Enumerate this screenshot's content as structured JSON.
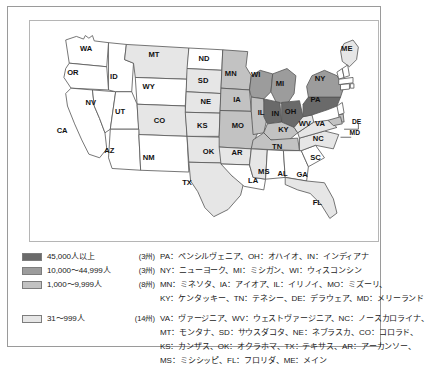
{
  "figure": {
    "type": "choropleth-map",
    "region": "United States"
  },
  "map": {
    "title": "",
    "state_labels": [
      {
        "code": "WA",
        "x": 63,
        "y": 30
      },
      {
        "code": "OR",
        "x": 48,
        "y": 57
      },
      {
        "code": "ID",
        "x": 94,
        "y": 62
      },
      {
        "code": "MT",
        "x": 139,
        "y": 37
      },
      {
        "code": "ND",
        "x": 195,
        "y": 42
      },
      {
        "code": "SD",
        "x": 194,
        "y": 66
      },
      {
        "code": "NE",
        "x": 197,
        "y": 90
      },
      {
        "code": "WY",
        "x": 133,
        "y": 73
      },
      {
        "code": "NV",
        "x": 68,
        "y": 91
      },
      {
        "code": "UT",
        "x": 101,
        "y": 101
      },
      {
        "code": "CA",
        "x": 36,
        "y": 122
      },
      {
        "code": "AZ",
        "x": 89,
        "y": 145
      },
      {
        "code": "CO",
        "x": 145,
        "y": 111
      },
      {
        "code": "NM",
        "x": 133,
        "y": 152
      },
      {
        "code": "KS",
        "x": 193,
        "y": 117
      },
      {
        "code": "OK",
        "x": 200,
        "y": 146
      },
      {
        "code": "TX",
        "x": 176,
        "y": 181
      },
      {
        "code": "MN",
        "x": 225,
        "y": 58
      },
      {
        "code": "IA",
        "x": 232,
        "y": 88
      },
      {
        "code": "MO",
        "x": 233,
        "y": 117
      },
      {
        "code": "AR",
        "x": 232,
        "y": 147
      },
      {
        "code": "LA",
        "x": 250,
        "y": 178
      },
      {
        "code": "MS",
        "x": 262,
        "y": 168
      },
      {
        "code": "AL",
        "x": 283,
        "y": 170
      },
      {
        "code": "GA",
        "x": 305,
        "y": 171
      },
      {
        "code": "FL",
        "x": 322,
        "y": 203
      },
      {
        "code": "WI",
        "x": 253,
        "y": 60
      },
      {
        "code": "IL",
        "x": 259,
        "y": 102
      },
      {
        "code": "MI",
        "x": 280,
        "y": 70
      },
      {
        "code": "IN",
        "x": 275,
        "y": 103
      },
      {
        "code": "OH",
        "x": 292,
        "y": 101
      },
      {
        "code": "KY",
        "x": 284,
        "y": 121
      },
      {
        "code": "TN",
        "x": 277,
        "y": 140
      },
      {
        "code": "PA",
        "x": 320,
        "y": 87
      },
      {
        "code": "NY",
        "x": 325,
        "y": 64
      },
      {
        "code": "WV",
        "x": 308,
        "y": 114
      },
      {
        "code": "VA",
        "x": 325,
        "y": 114
      },
      {
        "code": "NC",
        "x": 323,
        "y": 131
      },
      {
        "code": "SC",
        "x": 320,
        "y": 152
      },
      {
        "code": "ME",
        "x": 355,
        "y": 30
      },
      {
        "code": "DE",
        "x": 366,
        "y": 112
      },
      {
        "code": "MD",
        "x": 364,
        "y": 124
      }
    ],
    "tier_of_state": {
      "PA": 1,
      "OH": 1,
      "IN": 1,
      "NY": 2,
      "MI": 2,
      "WI": 2,
      "MN": 3,
      "IA": 3,
      "IL": 3,
      "MO": 3,
      "KY": 3,
      "TN": 3,
      "DE": 3,
      "MD": 3,
      "VA": 4,
      "WV": 4,
      "NC": 4,
      "MT": 4,
      "SD": 4,
      "NE": 4,
      "CO": 4,
      "KS": 4,
      "OK": 4,
      "TX": 4,
      "AR": 4,
      "MS": 4,
      "FL": 4,
      "ME": 4,
      "WA": 0,
      "OR": 0,
      "ID": 0,
      "WY": 0,
      "NV": 0,
      "UT": 0,
      "CA": 0,
      "AZ": 0,
      "NM": 0,
      "ND": 0,
      "LA": 0,
      "AL": 0,
      "GA": 0,
      "SC": 0,
      "NH": 0,
      "VT": 0,
      "MA": 0,
      "CT": 0,
      "RI": 0,
      "NJ": 0
    },
    "tier_colors": {
      "0": "#ffffff",
      "1": "#6a6a6a",
      "2": "#9c9c9c",
      "3": "#c2c2c2",
      "4": "#e6e6e6"
    },
    "border_color": "#555555"
  },
  "legend": {
    "rows": [
      {
        "swatch_color": "#6a6a6a",
        "label": "45,000人以上",
        "count": "(3州)",
        "states_lines": [
          "PA：ペンシルヴェニア、OH：オハイオ、IN：インディアナ"
        ]
      },
      {
        "swatch_color": "#9c9c9c",
        "label": "10,000〜44,999人",
        "count": "(3州)",
        "states_lines": [
          "NY：ニューヨーク、MI：ミシガン、WI：ウィスコンシン"
        ]
      },
      {
        "swatch_color": "#c2c2c2",
        "label": "1,000〜9,999人",
        "count": "(8州)",
        "states_lines": [
          "MN：ミネソタ、IA：アイオア、IL：イリノイ、MO：ミズーリ、",
          "KY：ケンタッキー、TN：テネシー、DE：デラウェア、MD：メリーランド"
        ]
      },
      {
        "swatch_color": "#e6e6e6",
        "label": "31〜999人",
        "count": "(14州)",
        "states_lines": [
          "VA：ヴァージニア、WV：ウェストヴァージニア、NC：ノースカロライナ、",
          "MT：モンタナ、SD：サウスダコタ、NE：ネブラスカ、CO：コロラド、",
          "KS：カンザス、OK：オクラホマ、TX：テキサス、AR：アーカンソー、",
          "MS：ミシシッピ、FL：フロリダ、ME：メイン"
        ]
      }
    ]
  }
}
